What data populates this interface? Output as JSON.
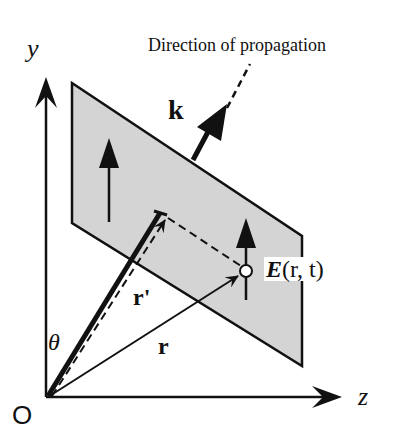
{
  "figure": {
    "title": "Direction of propagation",
    "labels": {
      "y_axis": "y",
      "z_axis": "z",
      "origin": "O",
      "wave_vector": "k",
      "position_projection": "r'",
      "position": "r",
      "angle": "θ",
      "field_E": "E",
      "field_args": "(r, t)"
    },
    "colors": {
      "plane_fill": "#d4d4d4",
      "stroke": "#111111",
      "background": "#ffffff"
    },
    "geometry": {
      "plane": [
        [
          72,
          83
        ],
        [
          302,
          236
        ],
        [
          302,
          366
        ],
        [
          72,
          223
        ]
      ],
      "origin": [
        47,
        397
      ],
      "point_E": [
        246,
        271
      ]
    }
  }
}
